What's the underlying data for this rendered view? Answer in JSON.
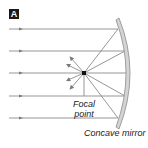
{
  "figure": {
    "panel_label": "A",
    "labels": {
      "focal_point_line1": "Focal",
      "focal_point_line2": "point",
      "mirror": "Concave mirror"
    },
    "colors": {
      "ray": "#8a8a8a",
      "mirror_fill": "#d4d4d4",
      "mirror_edge": "#8c8c8c",
      "focal_point": "#111111",
      "label_box": "#1a1a1a"
    },
    "incoming_rays_y": [
      29,
      51,
      73,
      96,
      118
    ],
    "focal_point": {
      "x": 84,
      "y": 73
    }
  }
}
